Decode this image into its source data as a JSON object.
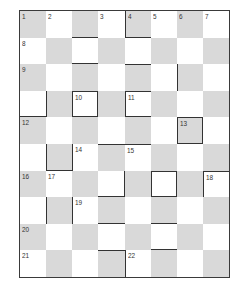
{
  "puzzle": {
    "type": "crossword-grid",
    "rows": 10,
    "cols": 8,
    "colors": {
      "shade": "#d9d9d9",
      "light": "#ffffff",
      "line": "#333333"
    },
    "numbers": [
      {
        "r": 0,
        "c": 0,
        "n": "1"
      },
      {
        "r": 0,
        "c": 1,
        "n": "2"
      },
      {
        "r": 0,
        "c": 3,
        "n": "3"
      },
      {
        "r": 0,
        "c": 4,
        "n": "4"
      },
      {
        "r": 0,
        "c": 5,
        "n": "5"
      },
      {
        "r": 0,
        "c": 6,
        "n": "6"
      },
      {
        "r": 0,
        "c": 7,
        "n": "7"
      },
      {
        "r": 1,
        "c": 0,
        "n": "8"
      },
      {
        "r": 2,
        "c": 0,
        "n": "9"
      },
      {
        "r": 3,
        "c": 2,
        "n": "10"
      },
      {
        "r": 3,
        "c": 4,
        "n": "11"
      },
      {
        "r": 4,
        "c": 0,
        "n": "12"
      },
      {
        "r": 4,
        "c": 6,
        "n": "13"
      },
      {
        "r": 5,
        "c": 2,
        "n": "14"
      },
      {
        "r": 5,
        "c": 4,
        "n": "15"
      },
      {
        "r": 6,
        "c": 0,
        "n": "16"
      },
      {
        "r": 6,
        "c": 1,
        "n": "17"
      },
      {
        "r": 6,
        "c": 7,
        "n": "18"
      },
      {
        "r": 7,
        "c": 2,
        "n": "19"
      },
      {
        "r": 8,
        "c": 0,
        "n": "20"
      },
      {
        "r": 9,
        "c": 0,
        "n": "21"
      },
      {
        "r": 9,
        "c": 4,
        "n": "22"
      }
    ],
    "bold_borders": [
      {
        "r": 0,
        "c": 4,
        "sides": "bl"
      },
      {
        "r": 0,
        "c": 2,
        "sides": "b"
      },
      {
        "r": 1,
        "c": 2,
        "sides": "b"
      },
      {
        "r": 2,
        "c": 4,
        "sides": "t"
      },
      {
        "r": 2,
        "c": 6,
        "sides": "l"
      },
      {
        "r": 3,
        "c": 0,
        "sides": "b"
      },
      {
        "r": 3,
        "c": 1,
        "sides": "l"
      },
      {
        "r": 3,
        "c": 2,
        "sides": "tlrb"
      },
      {
        "r": 3,
        "c": 4,
        "sides": "tlb"
      },
      {
        "r": 4,
        "c": 6,
        "sides": "tlrb"
      },
      {
        "r": 5,
        "c": 1,
        "sides": "lb"
      },
      {
        "r": 5,
        "c": 2,
        "sides": "l"
      },
      {
        "r": 5,
        "c": 3,
        "sides": "t"
      },
      {
        "r": 5,
        "c": 4,
        "sides": "t"
      },
      {
        "r": 6,
        "c": 3,
        "sides": "rb"
      },
      {
        "r": 6,
        "c": 5,
        "sides": "tlrb"
      },
      {
        "r": 6,
        "c": 7,
        "sides": "tl"
      },
      {
        "r": 7,
        "c": 1,
        "sides": "l"
      },
      {
        "r": 7,
        "c": 2,
        "sides": "l"
      },
      {
        "r": 7,
        "c": 3,
        "sides": "b"
      },
      {
        "r": 7,
        "c": 5,
        "sides": "b"
      },
      {
        "r": 8,
        "c": 5,
        "sides": "b"
      },
      {
        "r": 9,
        "c": 3,
        "sides": "t"
      },
      {
        "r": 9,
        "c": 4,
        "sides": "l"
      }
    ]
  }
}
